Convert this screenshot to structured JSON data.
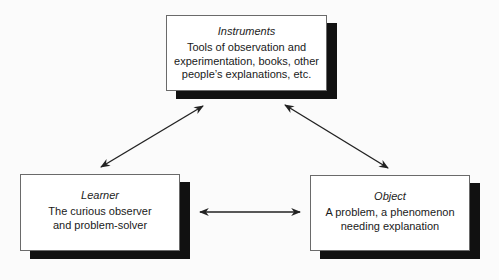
{
  "diagram": {
    "type": "triangular relationship diagram",
    "nodes": [
      {
        "id": "instruments",
        "title": "Instruments",
        "description": "Tools of observation and\nexperimentation, books, other\npeople’s explanations, etc."
      },
      {
        "id": "learner",
        "title": "Learner",
        "description": "The curious observer\nand problem-solver"
      },
      {
        "id": "object",
        "title": "Object",
        "description": "A problem, a phenomenon\nneeding explanation"
      }
    ],
    "edges": [
      {
        "from": "learner",
        "to": "instruments",
        "style": "double-headed-arrow"
      },
      {
        "from": "instruments",
        "to": "object",
        "style": "double-headed-arrow"
      },
      {
        "from": "learner",
        "to": "object",
        "style": "double-headed-arrow"
      }
    ],
    "colors": {
      "box_fill": "#ffffff",
      "box_border": "#6a6a6a",
      "shadow": "#111111",
      "arrow": "#222222",
      "background": "#fbfbfb"
    }
  }
}
